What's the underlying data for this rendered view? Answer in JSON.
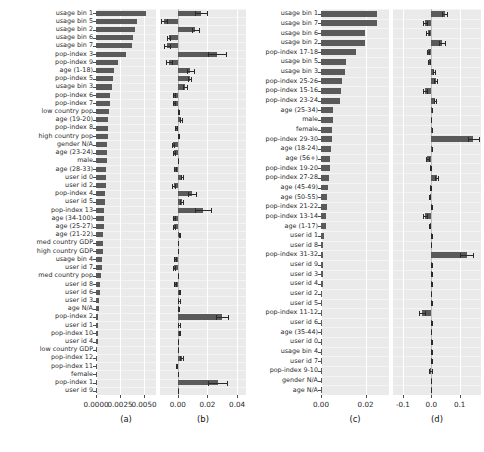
{
  "figure": {
    "width": 484,
    "height": 452,
    "background": "#ffffff",
    "panel_background": "#eaeaea",
    "bar_color": "#5a5a5a",
    "error_color": "#2a2a2a",
    "gridline_color": "#ffffff"
  },
  "chart_data": [
    {
      "type": "bar",
      "orientation": "horizontal",
      "title": "",
      "panel_label": "(a)",
      "xlabel": "",
      "ylabel": "",
      "xlim": [
        0.0,
        0.00625
      ],
      "xticks": [
        0.0,
        0.0025,
        0.005
      ],
      "xticklabels": [
        "0.0000",
        "0.0025",
        "0.0050"
      ],
      "grid": true,
      "categories": [
        "usage bin 1",
        "usage bin 5",
        "usage bin 2",
        "usage bin 6",
        "usage bin 7",
        "pop-index 3",
        "pop-index 9",
        "age (1-18)",
        "pop-index 5",
        "usage bin 3",
        "pop-index 6",
        "pop-index 7",
        "low country pop",
        "age (19-20)",
        "pop-index 8",
        "high country pop",
        "gender N/A",
        "age (23-24)",
        "male",
        "age (28-33)",
        "user id 0",
        "user id 2",
        "pop-index 4",
        "user id 5",
        "pop-index 13",
        "age (34-100)",
        "age (25-27)",
        "age (21-22)",
        "med country GDP",
        "high country GDP",
        "usage bin 4",
        "user id 7",
        "med country pop",
        "user id 8",
        "user id 6",
        "user id 3",
        "age N/A",
        "pop-index 2",
        "user id 1",
        "pop-index 10",
        "user id 4",
        "low country GDP",
        "pop-index 12",
        "pop-index 11",
        "female",
        "pop-index 1",
        "user id 9"
      ],
      "values": [
        0.0052,
        0.0043,
        0.00405,
        0.00385,
        0.00372,
        0.0031,
        0.00228,
        0.0019,
        0.00175,
        0.0017,
        0.0015,
        0.00143,
        0.00135,
        0.0013,
        0.00126,
        0.00122,
        0.00118,
        0.00115,
        0.00112,
        0.00108,
        0.00104,
        0.001,
        0.00096,
        0.00092,
        0.00088,
        0.00084,
        0.0008,
        0.00076,
        0.00072,
        0.00068,
        0.00062,
        0.00058,
        0.0005,
        0.00046,
        0.00044,
        0.00036,
        0.00026,
        0.00024,
        0.00022,
        0.0002,
        0.00017,
        0.00015,
        0.00013,
        0.00011,
        6e-05,
        3e-05,
        1e-05
      ]
    },
    {
      "type": "bar",
      "orientation": "horizontal",
      "panel_label": "(b)",
      "xlabel": "",
      "ylabel": "",
      "xlim": [
        -0.012,
        0.046
      ],
      "xticks": [
        0.0,
        0.02,
        0.04
      ],
      "xticklabels": [
        "0.00",
        "0.02",
        "0.04"
      ],
      "grid": true,
      "categories": [
        "usage bin 1",
        "usage bin 5",
        "usage bin 2",
        "usage bin 6",
        "usage bin 7",
        "pop-index 3",
        "pop-index 9",
        "age (1-18)",
        "pop-index 5",
        "usage bin 3",
        "pop-index 6",
        "pop-index 7",
        "low country pop",
        "age (19-20)",
        "pop-index 8",
        "high country pop",
        "gender N/A",
        "age (23-24)",
        "male",
        "age (28-33)",
        "user id 0",
        "user id 2",
        "pop-index 4",
        "user id 5",
        "pop-index 13",
        "age (34-100)",
        "age (25-27)",
        "age (21-22)",
        "med country GDP",
        "high country GDP",
        "usage bin 4",
        "user id 7",
        "med country pop",
        "user id 8",
        "user id 6",
        "user id 3",
        "age N/A",
        "pop-index 2",
        "user id 1",
        "pop-index 10",
        "user id 4",
        "low country GDP",
        "pop-index 12",
        "pop-index 11",
        "female",
        "pop-index 1",
        "user id 9"
      ],
      "values": [
        0.0158,
        -0.009,
        0.0118,
        -0.006,
        -0.0072,
        0.0265,
        -0.0058,
        0.0085,
        0.008,
        0.005,
        -0.0026,
        -0.0026,
        0.0002,
        0.0022,
        -0.0012,
        0.0002,
        -0.0034,
        -0.0026,
        0.0001,
        -0.002,
        0.003,
        -0.0028,
        0.0098,
        0.0028,
        0.0168,
        -0.0028,
        -0.0026,
        0.001,
        0.0,
        0.0001,
        -0.0018,
        -0.0024,
        0.0,
        -0.002,
        0.001,
        0.0008,
        0.0003,
        0.03,
        0.0008,
        0.0009,
        0.0001,
        0.0001,
        0.0026,
        -0.0008,
        0.0001,
        0.0268,
        0.0002
      ],
      "errors": [
        0.004,
        0.002,
        0.0024,
        0.001,
        0.002,
        0.006,
        0.002,
        0.0024,
        0.0012,
        0.0012,
        0.0008,
        0.0008,
        0.0003,
        0.0008,
        0.0005,
        0.0003,
        0.0008,
        0.0008,
        0.0002,
        0.0006,
        0.0008,
        0.0008,
        0.0028,
        0.001,
        0.0055,
        0.0006,
        0.0006,
        0.0005,
        0.0002,
        0.0002,
        0.0005,
        0.0006,
        0.0002,
        0.0005,
        0.0004,
        0.0004,
        0.0002,
        0.004,
        0.0004,
        0.0004,
        0.0002,
        0.0002,
        0.001,
        0.0003,
        0.0002,
        0.0062,
        0.0002
      ]
    },
    {
      "type": "bar",
      "orientation": "horizontal",
      "panel_label": "(c)",
      "xlabel": "",
      "ylabel": "",
      "xlim": [
        0.0,
        0.0305
      ],
      "xticks": [
        0.0,
        0.02
      ],
      "xticklabels": [
        "0.00",
        "0.02"
      ],
      "grid": true,
      "categories": [
        "usage bin 1",
        "usage bin 7",
        "usage bin 6",
        "usage bin 2",
        "pop-index 17-18",
        "usage bin 5",
        "usage bin 3",
        "pop-index 25-26",
        "pop-index 15-16",
        "pop-index 23-24",
        "age (25-34)",
        "male",
        "female",
        "pop-index 29-30",
        "age (18-24)",
        "age (56+)",
        "pop-index 19-20",
        "pop-index 27-28",
        "age (45-49)",
        "age (50-55)",
        "pop-index 21-22",
        "pop-index 13-14",
        "age (1-17)",
        "user id 1",
        "user id 8",
        "pop-index 31-32",
        "user id 9",
        "user id 3",
        "user id 4",
        "user id 2",
        "user id 5",
        "pop-index 11-12",
        "user id 6",
        "age (35-44)",
        "user id 0",
        "usage bin 4",
        "user id 7",
        "pop-index 9-10",
        "gender N/A",
        "age N/A"
      ],
      "values": [
        0.0253,
        0.025,
        0.0198,
        0.0197,
        0.0158,
        0.0112,
        0.0107,
        0.0092,
        0.009,
        0.0083,
        0.0056,
        0.0052,
        0.005,
        0.0049,
        0.0044,
        0.0042,
        0.004,
        0.0038,
        0.003,
        0.0029,
        0.0026,
        0.0023,
        0.0022,
        0.0012,
        0.001,
        0.0009,
        0.0008,
        0.0007,
        0.0007,
        0.0006,
        0.0006,
        0.0005,
        0.0004,
        0.0002,
        0.0002,
        0.0001,
        0.0001,
        0.0001,
        0.0,
        0.0
      ]
    },
    {
      "type": "bar",
      "orientation": "horizontal",
      "panel_label": "(d)",
      "xlabel": "",
      "ylabel": "",
      "xlim": [
        -0.135,
        0.175
      ],
      "xticks": [
        -0.1,
        0.0,
        0.1
      ],
      "xticklabels": [
        "-0.1",
        "0.0",
        "0.1"
      ],
      "grid": true,
      "categories": [
        "usage bin 1",
        "usage bin 7",
        "usage bin 6",
        "usage bin 2",
        "pop-index 17-18",
        "usage bin 5",
        "usage bin 3",
        "pop-index 25-26",
        "pop-index 15-16",
        "pop-index 23-24",
        "age (25-34)",
        "male",
        "female",
        "pop-index 29-30",
        "age (18-24)",
        "age (56+)",
        "pop-index 19-20",
        "pop-index 27-28",
        "age (45-49)",
        "age (50-55)",
        "pop-index 21-22",
        "pop-index 13-14",
        "age (1-17)",
        "user id 1",
        "user id 8",
        "pop-index 31-32",
        "user id 9",
        "user id 3",
        "user id 4",
        "user id 2",
        "user id 5",
        "pop-index 11-12",
        "user id 6",
        "age (35-44)",
        "user id 0",
        "usage bin 4",
        "user id 7",
        "pop-index 9-10",
        "gender N/A",
        "age N/A"
      ],
      "values": [
        0.047,
        -0.023,
        -0.013,
        0.0375,
        -0.0105,
        -0.0095,
        0.0105,
        0.015,
        -0.0215,
        0.012,
        0.002,
        -0.0015,
        0.002,
        0.148,
        0.0018,
        -0.0145,
        -0.003,
        0.019,
        -0.004,
        -0.006,
        0.0008,
        -0.023,
        -0.006,
        0.0012,
        -0.001,
        0.124,
        0.0008,
        0.0008,
        0.001,
        -0.001,
        0.0008,
        -0.033,
        0.0006,
        -0.0005,
        0.0004,
        0.0004,
        0.0004,
        -0.004,
        0.0,
        0.0
      ],
      "errors": [
        0.009,
        0.0075,
        0.0045,
        0.009,
        0.004,
        0.0035,
        0.0035,
        0.005,
        0.0075,
        0.0035,
        0.0012,
        0.001,
        0.0012,
        0.019,
        0.001,
        0.005,
        0.0015,
        0.0055,
        0.0015,
        0.002,
        0.0008,
        0.0075,
        0.002,
        0.0008,
        0.0006,
        0.0215,
        0.0006,
        0.0006,
        0.0006,
        0.0006,
        0.0006,
        0.0105,
        0.0005,
        0.0005,
        0.0004,
        0.0004,
        0.0004,
        0.0055,
        0.0002,
        0.0002
      ]
    }
  ]
}
